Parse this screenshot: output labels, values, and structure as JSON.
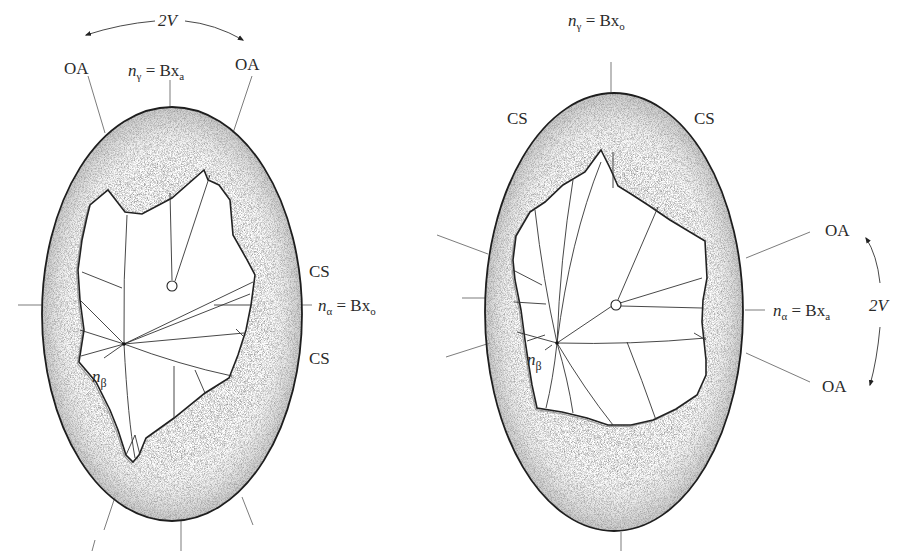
{
  "figure": {
    "panels": [
      {
        "id": "left",
        "labels": {
          "two_v": "2V",
          "oa_left": "OA",
          "oa_right": "OA",
          "n_gamma_prefix": "n",
          "n_gamma_sub": "γ",
          "n_gamma_eq": " = Bx",
          "n_gamma_eq_sub": "a",
          "cs_upper": "CS",
          "cs_lower": "CS",
          "n_alpha_prefix": "n",
          "n_alpha_sub": "α",
          "n_alpha_eq": " = Bx",
          "n_alpha_eq_sub": "o",
          "n_beta_prefix": "n",
          "n_beta_sub": "β"
        }
      },
      {
        "id": "right",
        "labels": {
          "n_gamma_prefix": "n",
          "n_gamma_sub": "γ",
          "n_gamma_eq": " = Bx",
          "n_gamma_eq_sub": "o",
          "cs_left": "CS",
          "cs_right": "CS",
          "oa_upper": "OA",
          "oa_lower": "OA",
          "n_alpha_prefix": "n",
          "n_alpha_sub": "α",
          "n_alpha_eq": " = Bx",
          "n_alpha_eq_sub": "a",
          "two_v": "2V",
          "n_beta_prefix": "n",
          "n_beta_sub": "β"
        }
      }
    ],
    "colors": {
      "ink": "#1e1e1e",
      "stipple": "#bdbdbd",
      "background": "#ffffff"
    }
  }
}
